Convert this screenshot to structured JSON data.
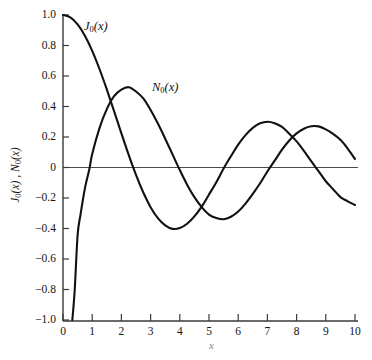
{
  "chart_data": {
    "type": "line",
    "title": "",
    "xlabel": "x",
    "ylabel": "J0(x) , N0(x)",
    "xlim": [
      0,
      10
    ],
    "ylim": [
      -1.0,
      1.0
    ],
    "grid": false,
    "legend_position": "inline-curve-labels",
    "xticks": [
      0,
      1,
      2,
      3,
      4,
      5,
      6,
      7,
      8,
      9,
      10
    ],
    "xtick_labels": [
      "0",
      "1",
      "2",
      "3",
      "4",
      "5",
      "6",
      "7",
      "8",
      "9",
      "10"
    ],
    "yticks": [
      1.0,
      0.8,
      0.6,
      0.4,
      0.2,
      0,
      -0.2,
      -0.4,
      -0.6,
      -0.8,
      -1.0
    ],
    "ytick_labels": [
      "1.0",
      "0.8",
      "0.6",
      "0.4",
      "0.2",
      "0",
      "−0.2",
      "−0.4",
      "−0.6",
      "−0.8",
      "−1.0"
    ],
    "series": [
      {
        "name": "J0(x)",
        "label_text": "J",
        "label_sub": "0",
        "label_arg": "(x)",
        "color": "#111111",
        "x": [
          0,
          0.25,
          0.5,
          0.75,
          1.0,
          1.25,
          1.5,
          1.75,
          2.0,
          2.25,
          2.5,
          2.75,
          3.0,
          3.25,
          3.5,
          3.75,
          4.0,
          4.25,
          4.5,
          4.75,
          5.0,
          5.25,
          5.5,
          5.75,
          6.0,
          6.25,
          6.5,
          6.75,
          7.0,
          7.25,
          7.5,
          7.75,
          8.0,
          8.25,
          8.5,
          8.75,
          9.0,
          9.25,
          9.5,
          9.75,
          10.0
        ],
        "y": [
          1.0,
          0.9844,
          0.9385,
          0.8642,
          0.7652,
          0.6459,
          0.5118,
          0.369,
          0.2239,
          0.0827,
          -0.0484,
          -0.1641,
          -0.2601,
          -0.3325,
          -0.3801,
          -0.4026,
          -0.3971,
          -0.3687,
          -0.3205,
          -0.2566,
          -0.1776,
          -0.0968,
          -0.0068,
          0.074,
          0.1506,
          0.2126,
          0.2601,
          0.2898,
          0.3001,
          0.2907,
          0.2663,
          0.2207,
          0.1717,
          0.1096,
          0.0419,
          -0.0238,
          -0.0903,
          -0.1422,
          -0.1939,
          -0.2218,
          -0.2459
        ]
      },
      {
        "name": "N0(x)",
        "label_text": "N",
        "label_sub": "0",
        "label_arg": "(x)",
        "color": "#111111",
        "x": [
          0.32,
          0.4,
          0.5,
          0.6,
          0.75,
          0.9,
          1.0,
          1.25,
          1.5,
          1.75,
          2.0,
          2.25,
          2.5,
          2.75,
          3.0,
          3.25,
          3.5,
          3.75,
          4.0,
          4.25,
          4.5,
          4.75,
          5.0,
          5.25,
          5.5,
          5.75,
          6.0,
          6.25,
          6.5,
          6.75,
          7.0,
          7.25,
          7.5,
          7.75,
          8.0,
          8.25,
          8.5,
          8.75,
          9.0,
          9.25,
          9.5,
          9.75,
          10.0
        ],
        "y": [
          -1.0,
          -0.8073,
          -0.4445,
          -0.3085,
          -0.1372,
          -0.0137,
          0.0883,
          0.2582,
          0.3824,
          0.468,
          0.5104,
          0.5267,
          0.4981,
          0.4529,
          0.3769,
          0.288,
          0.189,
          0.0861,
          -0.0169,
          -0.1125,
          -0.1947,
          -0.2596,
          -0.3085,
          -0.3312,
          -0.3395,
          -0.3232,
          -0.2882,
          -0.2364,
          -0.1732,
          -0.1035,
          -0.0259,
          0.045,
          0.1173,
          0.1772,
          0.2235,
          0.2545,
          0.27,
          0.2695,
          0.2499,
          0.2204,
          0.1813,
          0.1241,
          0.0557
        ]
      }
    ]
  },
  "labels": {
    "xlabel": "x",
    "ylabel_j": "J",
    "ylabel_j_sub": "0",
    "ylabel_j_arg": "(x)",
    "ylabel_sep": " , ",
    "ylabel_n": "N",
    "ylabel_n_sub": "0",
    "ylabel_n_arg": "(x)"
  },
  "style": {
    "background": "#ffffff",
    "axis_color": "#3a3a3a",
    "curve_color": "#111111",
    "zero_line_color": "#4a4a4a"
  }
}
